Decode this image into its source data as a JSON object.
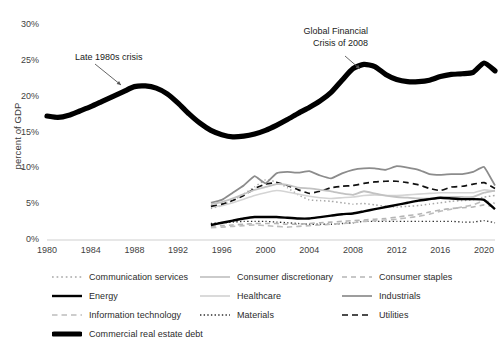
{
  "chart_data": {
    "type": "line",
    "title": "",
    "xlabel": "",
    "ylabel": "percent of GDP",
    "xlim": [
      1980,
      2021
    ],
    "ylim": [
      0,
      30
    ],
    "ytick_labels": [
      "0%",
      "5%",
      "10%",
      "15%",
      "20%",
      "25%",
      "30%"
    ],
    "ytick_values": [
      0,
      5,
      10,
      15,
      20,
      25,
      30
    ],
    "xtick_labels": [
      "1980",
      "1984",
      "1988",
      "1992",
      "1996",
      "2000",
      "2004",
      "2008",
      "2012",
      "2016",
      "2020"
    ],
    "xtick_values": [
      1980,
      1984,
      1988,
      1992,
      1996,
      2000,
      2004,
      2008,
      2012,
      2016,
      2020
    ],
    "grid": false,
    "legend_position": "below",
    "annotations": [
      {
        "text_line1": "Late 1980s crisis",
        "text_line2": "",
        "x": 1985.2,
        "y": 24.6
      },
      {
        "text_line1": "Global Financial",
        "text_line2": "Crisis of 2008",
        "x": 2008.0,
        "y": 28.2
      }
    ],
    "series": [
      {
        "name": "Commercial real estate debt",
        "style": "solid-thick",
        "color": "#000000",
        "width": 5.2,
        "x": [
          1980,
          1981,
          1982,
          1983,
          1984,
          1985,
          1986,
          1987,
          1988,
          1989,
          1990,
          1991,
          1992,
          1993,
          1994,
          1995,
          1996,
          1997,
          1998,
          1999,
          2000,
          2001,
          2002,
          2003,
          2004,
          2005,
          2006,
          2007,
          2008,
          2009,
          2010,
          2011,
          2012,
          2013,
          2014,
          2015,
          2016,
          2017,
          2018,
          2019,
          2020,
          2021
        ],
        "values": [
          17.3,
          17.1,
          17.4,
          18.0,
          18.6,
          19.3,
          20.0,
          20.7,
          21.4,
          21.5,
          21.2,
          20.4,
          19.1,
          17.6,
          16.3,
          15.3,
          14.7,
          14.4,
          14.5,
          14.8,
          15.3,
          16.0,
          16.8,
          17.7,
          18.5,
          19.4,
          20.6,
          22.3,
          23.9,
          24.5,
          24.2,
          23.1,
          22.4,
          22.1,
          22.1,
          22.3,
          22.8,
          23.1,
          23.2,
          23.4,
          24.7,
          23.6
        ]
      },
      {
        "name": "Industrials",
        "style": "solid",
        "color": "#8c8c8c",
        "width": 1.8,
        "x": [
          1995,
          1996,
          1997,
          1998,
          1999,
          2000,
          2001,
          2002,
          2003,
          2004,
          2005,
          2006,
          2007,
          2008,
          2009,
          2010,
          2011,
          2012,
          2013,
          2014,
          2015,
          2016,
          2017,
          2018,
          2019,
          2020,
          2021
        ],
        "values": [
          5.2,
          5.6,
          6.6,
          7.6,
          8.9,
          7.9,
          9.3,
          9.5,
          9.4,
          9.6,
          9.0,
          8.6,
          9.3,
          9.8,
          10.0,
          10.0,
          9.8,
          10.3,
          10.1,
          9.8,
          9.2,
          9.1,
          9.2,
          9.2,
          9.5,
          10.2,
          7.6
        ]
      },
      {
        "name": "Utilities",
        "style": "dashed",
        "color": "#111111",
        "width": 1.7,
        "x": [
          1995,
          1996,
          1997,
          1998,
          1999,
          2000,
          2001,
          2002,
          2003,
          2004,
          2005,
          2006,
          2007,
          2008,
          2009,
          2010,
          2011,
          2012,
          2013,
          2014,
          2015,
          2016,
          2017,
          2018,
          2019,
          2020,
          2021
        ],
        "values": [
          4.7,
          5.0,
          5.5,
          6.2,
          7.2,
          7.8,
          8.0,
          7.6,
          7.0,
          6.5,
          6.8,
          7.3,
          7.5,
          7.6,
          7.9,
          8.1,
          8.2,
          8.2,
          8.0,
          7.7,
          7.2,
          6.9,
          7.4,
          7.5,
          7.8,
          8.0,
          7.2
        ]
      },
      {
        "name": "Energy",
        "style": "solid-bold",
        "color": "#000000",
        "width": 2.4,
        "x": [
          1995,
          1996,
          1997,
          1998,
          1999,
          2000,
          2001,
          2002,
          2003,
          2004,
          2005,
          2006,
          2007,
          2008,
          2009,
          2010,
          2011,
          2012,
          2013,
          2014,
          2015,
          2016,
          2017,
          2018,
          2019,
          2020,
          2021
        ],
        "values": [
          2.1,
          2.4,
          2.7,
          3.0,
          3.2,
          3.2,
          3.2,
          3.1,
          3.0,
          3.0,
          3.2,
          3.4,
          3.6,
          3.7,
          4.0,
          4.3,
          4.6,
          4.9,
          5.2,
          5.5,
          5.7,
          5.9,
          5.8,
          5.7,
          5.7,
          5.6,
          4.3
        ]
      },
      {
        "name": "Consumer discretionary",
        "style": "solid-light",
        "color": "#c2c2c2",
        "width": 1.8,
        "x": [
          1995,
          1996,
          1997,
          1998,
          1999,
          2000,
          2001,
          2002,
          2003,
          2004,
          2005,
          2006,
          2007,
          2008,
          2009,
          2010,
          2011,
          2012,
          2013,
          2014,
          2015,
          2016,
          2017,
          2018,
          2019,
          2020,
          2021
        ],
        "values": [
          5.0,
          5.3,
          5.8,
          6.4,
          7.0,
          7.4,
          7.8,
          7.7,
          7.3,
          7.2,
          7.0,
          6.8,
          6.5,
          6.3,
          6.8,
          6.5,
          6.2,
          6.0,
          5.9,
          5.8,
          5.8,
          5.9,
          6.0,
          6.0,
          6.0,
          6.6,
          6.9
        ]
      },
      {
        "name": "Consumer staples",
        "style": "dashed-light",
        "color": "#b5b5b5",
        "width": 1.6,
        "x": [
          1995,
          1996,
          1997,
          1998,
          1999,
          2000,
          2001,
          2002,
          2003,
          2004,
          2005,
          2006,
          2007,
          2008,
          2009,
          2010,
          2011,
          2012,
          2013,
          2014,
          2015,
          2016,
          2017,
          2018,
          2019,
          2020,
          2021
        ],
        "values": [
          1.9,
          2.0,
          2.1,
          2.2,
          2.3,
          2.3,
          2.3,
          2.2,
          2.2,
          2.3,
          2.4,
          2.5,
          2.6,
          2.7,
          2.8,
          2.9,
          3.0,
          3.2,
          3.4,
          3.6,
          3.9,
          4.2,
          4.4,
          4.5,
          4.6,
          4.9,
          4.6
        ]
      },
      {
        "name": "Healthcare",
        "style": "solid-faint",
        "color": "#d4d4d4",
        "width": 1.6,
        "x": [
          1995,
          1996,
          1997,
          1998,
          1999,
          2000,
          2001,
          2002,
          2003,
          2004,
          2005,
          2006,
          2007,
          2008,
          2009,
          2010,
          2011,
          2012,
          2013,
          2014,
          2015,
          2016,
          2017,
          2018,
          2019,
          2020,
          2021
        ],
        "values": [
          4.6,
          4.8,
          5.2,
          5.7,
          6.2,
          6.6,
          6.9,
          6.7,
          6.4,
          6.1,
          5.9,
          5.8,
          5.9,
          6.0,
          6.2,
          6.3,
          6.2,
          6.2,
          6.3,
          6.4,
          6.5,
          6.6,
          6.6,
          6.6,
          6.6,
          7.0,
          6.8
        ]
      },
      {
        "name": "Communication services",
        "style": "dotted",
        "color": "#a8a8a8",
        "width": 1.5,
        "x": [
          1995,
          1996,
          1997,
          1998,
          1999,
          2000,
          2001,
          2002,
          2003,
          2004,
          2005,
          2006,
          2007,
          2008,
          2009,
          2010,
          2011,
          2012,
          2013,
          2014,
          2015,
          2016,
          2017,
          2018,
          2019,
          2020,
          2021
        ],
        "values": [
          4.4,
          4.8,
          5.5,
          6.4,
          7.4,
          8.4,
          8.1,
          7.3,
          6.3,
          5.6,
          5.5,
          5.4,
          5.2,
          5.0,
          5.1,
          4.9,
          4.7,
          4.6,
          4.7,
          4.8,
          5.0,
          5.2,
          5.4,
          5.5,
          5.6,
          6.0,
          6.2
        ]
      },
      {
        "name": "Information technology",
        "style": "dashed-mid",
        "color": "#bdbdbd",
        "width": 1.6,
        "x": [
          1995,
          1996,
          1997,
          1998,
          1999,
          2000,
          2001,
          2002,
          2003,
          2004,
          2005,
          2006,
          2007,
          2008,
          2009,
          2010,
          2011,
          2012,
          2013,
          2014,
          2015,
          2016,
          2017,
          2018,
          2019,
          2020,
          2021
        ],
        "values": [
          1.7,
          1.8,
          1.9,
          2.0,
          2.1,
          2.0,
          1.9,
          1.8,
          1.9,
          2.0,
          2.1,
          2.2,
          2.3,
          2.4,
          2.6,
          2.7,
          2.8,
          2.9,
          3.1,
          3.3,
          3.6,
          4.0,
          4.3,
          4.6,
          4.9,
          5.5,
          5.1
        ]
      },
      {
        "name": "Materials",
        "style": "dotted-dark",
        "color": "#2e2e2e",
        "width": 1.4,
        "x": [
          1995,
          1996,
          1997,
          1998,
          1999,
          2000,
          2001,
          2002,
          2003,
          2004,
          2005,
          2006,
          2007,
          2008,
          2009,
          2010,
          2011,
          2012,
          2013,
          2014,
          2015,
          2016,
          2017,
          2018,
          2019,
          2020,
          2021
        ],
        "values": [
          2.3,
          2.4,
          2.5,
          2.6,
          2.6,
          2.6,
          2.5,
          2.4,
          2.3,
          2.2,
          2.2,
          2.2,
          2.3,
          2.4,
          2.6,
          2.6,
          2.6,
          2.6,
          2.6,
          2.6,
          2.6,
          2.6,
          2.6,
          2.5,
          2.5,
          2.7,
          2.4
        ]
      }
    ]
  },
  "legend": {
    "items": [
      {
        "label": "Communication services",
        "style": "dotted",
        "color": "#a8a8a8"
      },
      {
        "label": "Consumer discretionary",
        "style": "solid-light",
        "color": "#c2c2c2"
      },
      {
        "label": "Consumer staples",
        "style": "dashed-light",
        "color": "#b5b5b5"
      },
      {
        "label": "Energy",
        "style": "solid-bold",
        "color": "#000000"
      },
      {
        "label": "Healthcare",
        "style": "solid-faint",
        "color": "#d4d4d4"
      },
      {
        "label": "Industrials",
        "style": "solid",
        "color": "#8c8c8c"
      },
      {
        "label": "Information technology",
        "style": "dashed-mid",
        "color": "#bdbdbd"
      },
      {
        "label": "Materials",
        "style": "dotted-dark",
        "color": "#2e2e2e"
      },
      {
        "label": "Utilities",
        "style": "dashed",
        "color": "#111111"
      },
      {
        "label": "Commercial real estate debt",
        "style": "solid-thick",
        "color": "#000000"
      }
    ]
  }
}
